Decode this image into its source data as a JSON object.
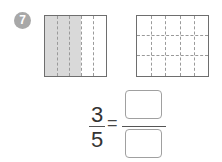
{
  "problem": {
    "number": "7",
    "badge_color": "#a8a8a8"
  },
  "left_grid": {
    "columns": 5,
    "rows": 1,
    "shaded_columns": 3,
    "shade_color": "#d9d9d9"
  },
  "right_grid": {
    "columns": 5,
    "rows": 3,
    "shaded_cells": 0
  },
  "equation": {
    "numerator": "3",
    "denominator": "5",
    "equals": "=",
    "answer_numerator": "",
    "answer_denominator": ""
  }
}
